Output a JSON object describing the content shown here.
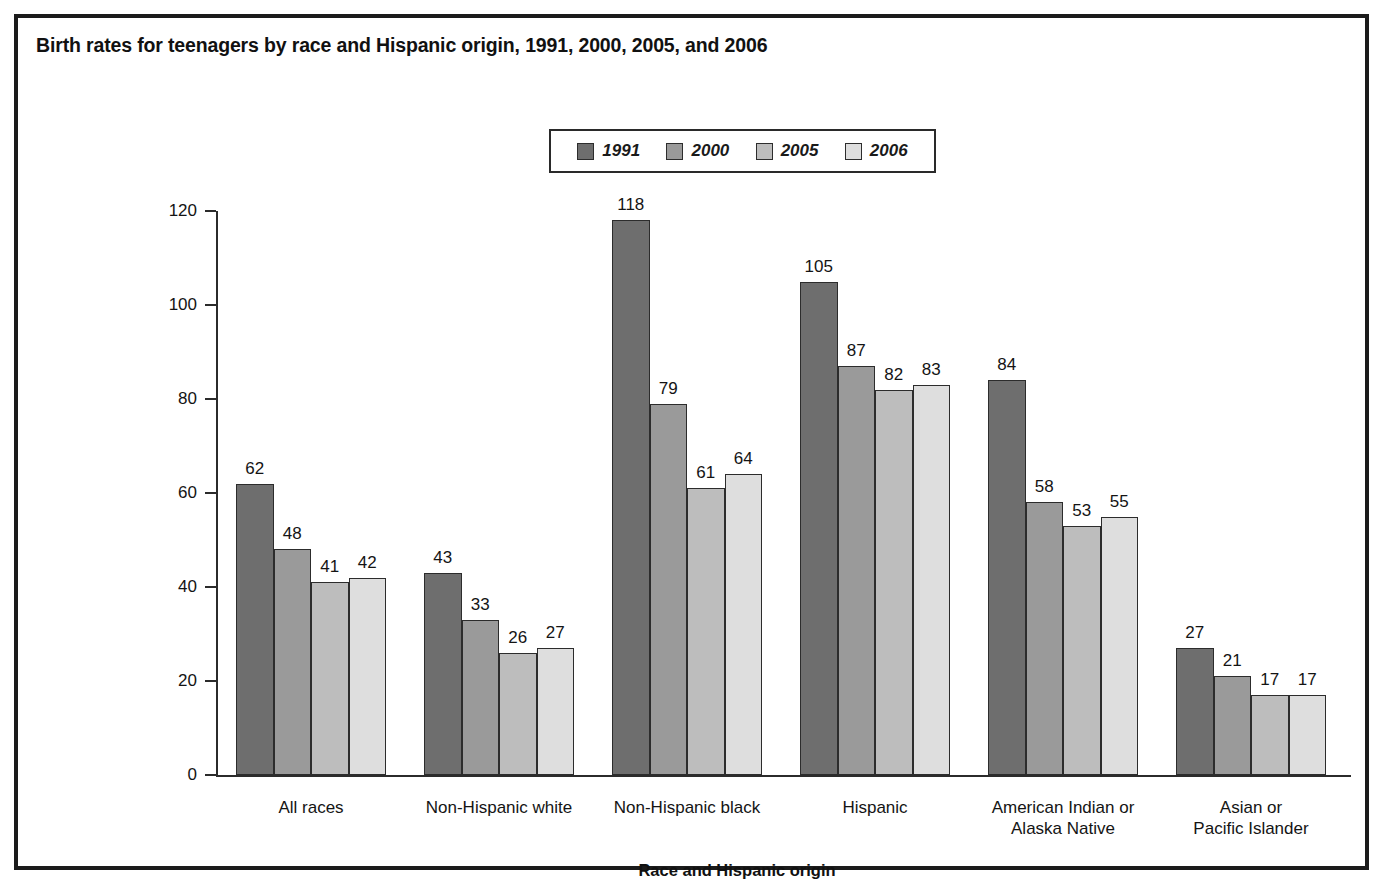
{
  "figure": {
    "title": "Birth rates for teenagers by race and Hispanic origin, 1991, 2000, 2005, and 2006",
    "border_color": "#1b1b1b",
    "background": "#ffffff"
  },
  "legend": {
    "position": "top-center",
    "entries": [
      {
        "label": "1991",
        "color": "#6e6e6e"
      },
      {
        "label": "2000",
        "color": "#9a9a9a"
      },
      {
        "label": "2005",
        "color": "#bdbdbd"
      },
      {
        "label": "2006",
        "color": "#dedede"
      }
    ]
  },
  "axes": {
    "y_title": "Rate per 1,000 females in specified group",
    "x_title": "Race and Hispanic origin",
    "y_ticks": [
      "0",
      "20",
      "40",
      "60",
      "80",
      "100",
      "120"
    ],
    "y_min": 0,
    "y_max": 120,
    "grid": false
  },
  "chart_data": {
    "type": "bar",
    "title": "Birth rates for teenagers by race and Hispanic origin, 1991, 2000, 2005, and 2006",
    "xlabel": "Race and Hispanic origin",
    "ylabel": "Rate per 1,000 females in specified group",
    "ylim": [
      0,
      120
    ],
    "ytick_step": 20,
    "grid": false,
    "legend_position": "top-center",
    "categories": [
      "All races",
      "Non-Hispanic white",
      "Non-Hispanic black",
      "Hispanic",
      "American Indian or Alaska Native",
      "Asian or Pacific Islander"
    ],
    "category_lines": [
      [
        "All races"
      ],
      [
        "Non-Hispanic white"
      ],
      [
        "Non-Hispanic black"
      ],
      [
        "Hispanic"
      ],
      [
        "American Indian or",
        "Alaska Native"
      ],
      [
        "Asian or",
        "Pacific Islander"
      ]
    ],
    "series": [
      {
        "name": "1991",
        "color": "#6e6e6e",
        "values": [
          62,
          43,
          118,
          105,
          84,
          27
        ]
      },
      {
        "name": "2000",
        "color": "#9a9a9a",
        "values": [
          48,
          33,
          79,
          87,
          58,
          21
        ]
      },
      {
        "name": "2005",
        "color": "#bdbdbd",
        "values": [
          41,
          26,
          61,
          82,
          53,
          17
        ]
      },
      {
        "name": "2006",
        "color": "#dedede",
        "values": [
          42,
          27,
          64,
          83,
          55,
          17
        ]
      }
    ]
  }
}
